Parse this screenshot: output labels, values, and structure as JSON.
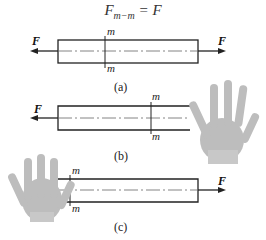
{
  "formula": {
    "main": "F",
    "sub": "m−m",
    "rhs": "= F"
  },
  "figures": [
    {
      "caption": "(a)",
      "force_left": "F",
      "force_right": "F",
      "section_top": "m",
      "section_bottom": "m"
    },
    {
      "caption": "(b)",
      "force_left": "F",
      "section_top": "m",
      "section_bottom": "m",
      "hand": "right-hand-icon"
    },
    {
      "caption": "(c)",
      "force_right": "F",
      "section_top": "m",
      "section_bottom": "m",
      "hand": "left-hand-icon"
    }
  ]
}
